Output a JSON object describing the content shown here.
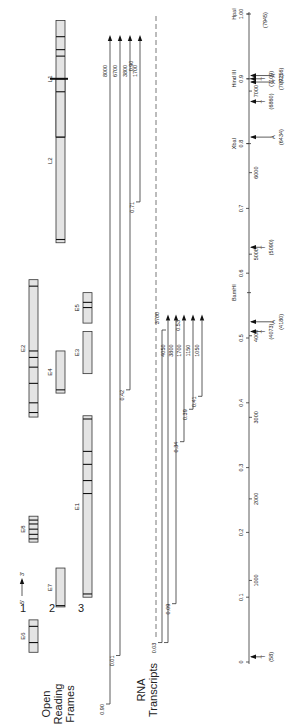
{
  "diagram": {
    "section_labels": {
      "orf": [
        "Open",
        "Reading",
        "Frames"
      ],
      "rna": [
        "RNA",
        "Transcripts"
      ]
    },
    "strand": {
      "five": "5'",
      "three": "3'"
    },
    "frames": [
      "1",
      "2",
      "3"
    ],
    "orfs": [
      {
        "name": "E6",
        "frame": 1,
        "start": 0.015,
        "end": 0.065,
        "bands": [
          0.03,
          0.055
        ]
      },
      {
        "name": "E7",
        "frame": 2,
        "start": 0.085,
        "end": 0.145,
        "bands": [
          0.087
        ]
      },
      {
        "name": "E8",
        "frame": 1,
        "start": 0.185,
        "end": 0.225,
        "bands": [
          0.19,
          0.197,
          0.205,
          0.213,
          0.219
        ]
      },
      {
        "name": "E1",
        "frame": 3,
        "start": 0.1,
        "end": 0.38,
        "bands": [
          0.105,
          0.26,
          0.28,
          0.305,
          0.325,
          0.375
        ]
      },
      {
        "name": "E2",
        "frame": 1,
        "start": 0.378,
        "end": 0.59,
        "bands": [
          0.385,
          0.4,
          0.43,
          0.455,
          0.47,
          0.48,
          0.58
        ]
      },
      {
        "name": "E4",
        "frame": 2,
        "start": 0.415,
        "end": 0.48,
        "bands": [
          0.42
        ]
      },
      {
        "name": "E3",
        "frame": 3,
        "start": 0.445,
        "end": 0.51,
        "bands": []
      },
      {
        "name": "E5",
        "frame": 3,
        "start": 0.523,
        "end": 0.57,
        "bands": [
          0.547,
          0.555
        ]
      },
      {
        "name": "L2",
        "frame": 2,
        "start": 0.647,
        "end": 0.9,
        "bands": [
          0.652
        ]
      },
      {
        "name": "L1",
        "frame": 2,
        "start": 0.81,
        "end": 0.99,
        "bands": [
          0.81,
          0.88,
          0.9,
          0.935,
          0.945,
          0.965
        ]
      }
    ],
    "transcripts_upper": [
      {
        "start_label": "0.90",
        "start": 0.0,
        "length_label": "8000",
        "end": 0.98
      },
      {
        "start_label": "0.01",
        "start": 0.01,
        "length_label": "6700",
        "end": 0.98
      },
      {
        "start_label": "0.42",
        "start": 0.42,
        "length_label": "3800",
        "end": 0.98
      },
      {
        "start_label": "0.71",
        "start": 0.71,
        "length_label": "1700",
        "end": 0.98
      }
    ],
    "upper_end_label": "0.90",
    "transcripts_lower": [
      {
        "start_label": "0.03",
        "start": 0.03,
        "length_label": "3700",
        "end": 0.53,
        "dashed_start": true
      },
      {
        "start_label": "",
        "start": 0.03,
        "length_label": "4050",
        "end": 0.53
      },
      {
        "start_label": "0.09",
        "start": 0.09,
        "length_label": "3800",
        "end": 0.53
      },
      {
        "start_label": "0.34",
        "start": 0.34,
        "length_label": "1700",
        "end": 0.53
      },
      {
        "start_label": "0.39",
        "start": 0.39,
        "length_label": "1150",
        "end": 0.53
      },
      {
        "start_label": "0.41",
        "start": 0.41,
        "length_label": "1050",
        "end": 0.53
      }
    ],
    "lower_end_label": "0.53",
    "scale": {
      "map_units": [
        "0",
        "0.1",
        "0.2",
        "0.3",
        "0.4",
        "0.5",
        "0.6",
        "0.7",
        "0.8",
        "0.9",
        "1.00"
      ],
      "bp_ticks": [
        "1000",
        "2000",
        "3000",
        "4000",
        "5000",
        "6000",
        "7000"
      ],
      "enzymes": [
        {
          "name": "BamHI",
          "pos": 0.57
        },
        {
          "name": "XbaI",
          "pos": 0.8
        },
        {
          "name": "Hind III",
          "pos": 0.9
        },
        {
          "name": "HpaI",
          "pos": 1.0
        }
      ],
      "sites": [
        {
          "base": "T",
          "coord": "(58)",
          "pos": 0.008
        },
        {
          "base": "T",
          "coord": "(4073)",
          "pos": 0.51
        },
        {
          "base": "A",
          "coord": "(4180)",
          "pos": 0.525
        },
        {
          "base": "T",
          "coord": "(5090)",
          "pos": 0.64
        },
        {
          "base": "A",
          "coord": "(6434)",
          "pos": 0.81
        },
        {
          "base": "T",
          "coord": "(6860)",
          "pos": 0.865
        },
        {
          "base": "A",
          "coord": "(7092)",
          "pos": 0.895
        },
        {
          "base": "T",
          "coord": "(7109)",
          "pos": 0.9
        },
        {
          "base": "A",
          "coord": "(7156)",
          "pos": 0.905
        },
        {
          "base": "",
          "coord": "(7945)",
          "pos": 1.0
        }
      ]
    }
  }
}
